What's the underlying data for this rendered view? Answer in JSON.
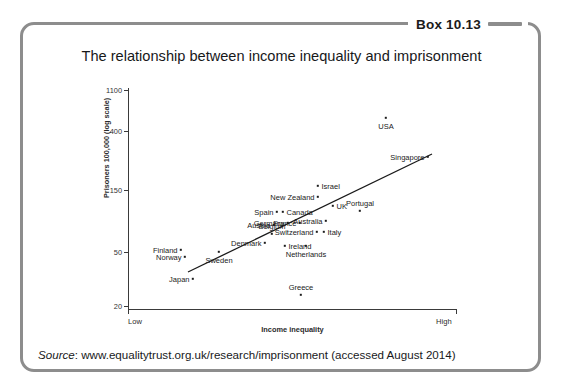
{
  "box": {
    "tab_label": "Box 10.13"
  },
  "chart_data": {
    "type": "scatter",
    "title": "The relationship between income inequality and imprisonment",
    "xlabel": "Income inequality",
    "ylabel": "Prisoners 100,000 (log scale)",
    "grid": false,
    "legend": null,
    "x_axis": {
      "scale": "qualitative",
      "min_label": "Low",
      "max_label": "High",
      "ticks": [
        "Low",
        "High"
      ]
    },
    "y_axis": {
      "scale": "log",
      "tick_labels": [
        "1100",
        "400",
        "150",
        "50",
        "20"
      ],
      "tick_values": [
        1100,
        400,
        150,
        50,
        20
      ],
      "ylim": [
        18,
        1300
      ]
    },
    "trendline": {
      "type": "linear-fit",
      "from": {
        "px": 60,
        "py": 184
      },
      "to": {
        "px": 304,
        "py": 66
      }
    },
    "points": [
      {
        "label": "USA",
        "px": 258,
        "py": 30,
        "label_pos": "below",
        "value_y": 710,
        "value_x": "high"
      },
      {
        "label": "Singapore",
        "px": 300,
        "py": 69,
        "label_pos": "left",
        "value_y": 260,
        "value_x": "very high"
      },
      {
        "label": "Israel",
        "px": 190,
        "py": 98,
        "label_pos": "right",
        "value_y": 160,
        "value_x": "high"
      },
      {
        "label": "New Zealand",
        "px": 190,
        "py": 109,
        "label_pos": "left",
        "value_y": 145,
        "value_x": "mid-high"
      },
      {
        "label": "UK",
        "px": 205,
        "py": 118,
        "label_pos": "right",
        "value_y": 130,
        "value_x": "high"
      },
      {
        "label": "Portugal",
        "px": 232,
        "py": 123,
        "label_pos": "above",
        "value_y": 120,
        "value_x": "high"
      },
      {
        "label": "Spain",
        "px": 149,
        "py": 124,
        "label_pos": "left",
        "value_y": 120,
        "value_x": "mid"
      },
      {
        "label": "Canada",
        "px": 155,
        "py": 124,
        "label_pos": "right",
        "value_y": 120,
        "value_x": "mid"
      },
      {
        "label": "Australia",
        "px": 198,
        "py": 133,
        "label_pos": "left",
        "value_y": 110,
        "value_x": "mid-high"
      },
      {
        "label": "Germany",
        "px": 160,
        "py": 135,
        "label_pos": "left",
        "value_y": 105,
        "value_x": "low-mid"
      },
      {
        "label": "France",
        "px": 172,
        "py": 135,
        "label_pos": "left",
        "value_y": 105,
        "value_x": "mid"
      },
      {
        "label": "Austria",
        "px": 146,
        "py": 137,
        "label_pos": "left",
        "value_y": 100,
        "value_x": "low-mid"
      },
      {
        "label": "Italy",
        "px": 196,
        "py": 144,
        "label_pos": "right",
        "value_y": 95,
        "value_x": "mid-high"
      },
      {
        "label": "Switzerland",
        "px": 189,
        "py": 144,
        "label_pos": "left",
        "value_y": 95,
        "value_x": "mid"
      },
      {
        "label": "Belgium",
        "px": 144,
        "py": 146,
        "label_pos": "above",
        "value_y": 90,
        "value_x": "low-mid"
      },
      {
        "label": "Denmark",
        "px": 137,
        "py": 155,
        "label_pos": "left",
        "value_y": 75,
        "value_x": "low"
      },
      {
        "label": "Netherlands",
        "px": 178,
        "py": 158,
        "label_pos": "below",
        "value_y": 72,
        "value_x": "mid"
      },
      {
        "label": "Finland",
        "px": 53,
        "py": 162,
        "label_pos": "left",
        "value_y": 68,
        "value_x": "low"
      },
      {
        "label": "Norway",
        "px": 57,
        "py": 169,
        "label_pos": "left",
        "value_y": 63,
        "value_x": "low"
      },
      {
        "label": "Sweden",
        "px": 91,
        "py": 164,
        "label_pos": "below",
        "value_y": 66,
        "value_x": "low"
      },
      {
        "label": "Ireland",
        "px": 157,
        "py": 158,
        "label_pos": "right",
        "value_y": 72,
        "value_x": "mid"
      },
      {
        "label": "Japan",
        "px": 65,
        "py": 191,
        "label_pos": "left",
        "value_y": 40,
        "value_x": "low"
      },
      {
        "label": "Greece",
        "px": 173,
        "py": 207,
        "label_pos": "above",
        "value_y": 30,
        "value_x": "mid"
      }
    ]
  },
  "footer": {
    "source_word": "Source",
    "source_text": ": www.equalitytrust.org.uk/research/imprisonment (accessed August 2014)"
  }
}
